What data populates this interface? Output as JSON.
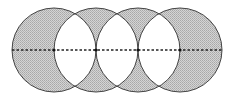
{
  "diagram": {
    "type": "overlapping-circles",
    "circle_count": 4,
    "circles": [
      {
        "cx": 54,
        "cy": 50,
        "r": 42
      },
      {
        "cx": 96,
        "cy": 50,
        "r": 42
      },
      {
        "cx": 138,
        "cy": 50,
        "r": 42
      },
      {
        "cx": 180,
        "cy": 50,
        "r": 42
      }
    ],
    "axis_line": {
      "x1": 12,
      "x2": 222,
      "y": 50,
      "style": "dashed"
    },
    "intersection_points": [
      54,
      96,
      138,
      180
    ],
    "colors": {
      "shaded_fill": "#c8c8c8",
      "hatch": "#9a9a9a",
      "lens_fill": "#ffffff",
      "stroke": "#444444"
    },
    "shading_rule": "regions inside exactly one circle are shaded; overlaps of two circles are white"
  }
}
